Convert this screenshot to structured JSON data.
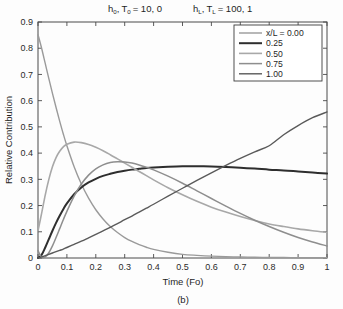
{
  "chart_data": {
    "type": "line",
    "title_parts": {
      "h0_base": "h",
      "h0_sub": "0",
      "t0_base": "T",
      "t0_sub": "0",
      "left_values": "= 10, 0",
      "hL_base": "h",
      "hL_sub": "L",
      "tL_base": "T",
      "tL_sub": "L",
      "right_values": "= 100, 1",
      "comma": ","
    },
    "xlabel": "Time (Fo)",
    "ylabel": "Relative Contribution",
    "caption": "(b)",
    "xlim": [
      0,
      1
    ],
    "ylim": [
      0,
      0.9
    ],
    "grid": false,
    "legend_position": "top-right",
    "legend_title": "x/L = 0.00",
    "xticks": [
      0,
      0.1,
      0.2,
      0.3,
      0.4,
      0.5,
      0.6,
      0.7,
      0.8,
      0.9,
      1
    ],
    "xticklabels": [
      "0",
      "0.1",
      "0.2",
      "0.3",
      "0.4",
      "0.5",
      "0.6",
      "0.7",
      "0.8",
      "0.9",
      "1"
    ],
    "yticks": [
      0,
      0.1,
      0.2,
      0.3,
      0.4,
      0.5,
      0.6,
      0.7,
      0.8,
      0.9
    ],
    "yticklabels": [
      "0",
      "0.1",
      "0.2",
      "0.3",
      "0.4",
      "0.5",
      "0.6",
      "0.7",
      "0.8",
      "0.9"
    ],
    "x": [
      0,
      0.0125,
      0.025,
      0.0375,
      0.05,
      0.0625,
      0.075,
      0.0875,
      0.1,
      0.125,
      0.15,
      0.175,
      0.2,
      0.225,
      0.25,
      0.275,
      0.3,
      0.325,
      0.35,
      0.375,
      0.4,
      0.45,
      0.5,
      0.55,
      0.6,
      0.65,
      0.7,
      0.75,
      0.8,
      0.85,
      0.9,
      0.95,
      1
    ],
    "series": [
      {
        "name": "x/L = 0.00",
        "label": "x/L = 0.00",
        "legend_label": "x/L = 0.00",
        "color": "#9a9a9a",
        "width": 1.4,
        "values": [
          0.852,
          0.8,
          0.742,
          0.684,
          0.628,
          0.574,
          0.522,
          0.473,
          0.428,
          0.348,
          0.282,
          0.228,
          0.184,
          0.149,
          0.12,
          0.097,
          0.078,
          0.063,
          0.051,
          0.041,
          0.033,
          0.022,
          0.014,
          0.01,
          0.007,
          0.005,
          0.004,
          0.003,
          0.002,
          0.002,
          0.001,
          0.001,
          0.001
        ]
      },
      {
        "name": "0.25",
        "label": "0.25",
        "legend_label": "0.25",
        "color": "#2e2e2e",
        "width": 2.0,
        "values": [
          0.0,
          0.012,
          0.04,
          0.072,
          0.104,
          0.134,
          0.161,
          0.186,
          0.208,
          0.243,
          0.269,
          0.288,
          0.302,
          0.313,
          0.321,
          0.328,
          0.333,
          0.337,
          0.34,
          0.343,
          0.345,
          0.348,
          0.35,
          0.35,
          0.349,
          0.347,
          0.344,
          0.341,
          0.337,
          0.334,
          0.33,
          0.326,
          0.322
        ]
      },
      {
        "name": "0.50",
        "label": "0.50",
        "legend_label": "0.50",
        "color": "#a8a8a8",
        "width": 1.6,
        "values": [
          0.104,
          0.17,
          0.24,
          0.3,
          0.348,
          0.383,
          0.407,
          0.424,
          0.434,
          0.442,
          0.44,
          0.433,
          0.422,
          0.409,
          0.394,
          0.378,
          0.362,
          0.346,
          0.33,
          0.314,
          0.298,
          0.268,
          0.241,
          0.216,
          0.194,
          0.175,
          0.158,
          0.143,
          0.13,
          0.12,
          0.111,
          0.104,
          0.098
        ]
      },
      {
        "name": "0.75",
        "label": "0.75",
        "legend_label": "0.75",
        "color": "#8e8e8e",
        "width": 1.5,
        "values": [
          0.028,
          0.003,
          0.004,
          0.02,
          0.046,
          0.078,
          0.112,
          0.146,
          0.178,
          0.236,
          0.282,
          0.316,
          0.34,
          0.355,
          0.364,
          0.367,
          0.366,
          0.362,
          0.355,
          0.346,
          0.336,
          0.312,
          0.285,
          0.256,
          0.227,
          0.198,
          0.17,
          0.144,
          0.12,
          0.098,
          0.078,
          0.061,
          0.046
        ]
      },
      {
        "name": "1.00",
        "label": "1.00",
        "legend_label": "1.00",
        "color": "#5a5a5a",
        "width": 1.4,
        "values": [
          0.0,
          0.004,
          0.009,
          0.014,
          0.019,
          0.024,
          0.029,
          0.034,
          0.04,
          0.052,
          0.064,
          0.077,
          0.09,
          0.103,
          0.117,
          0.131,
          0.146,
          0.16,
          0.175,
          0.19,
          0.205,
          0.236,
          0.266,
          0.296,
          0.325,
          0.353,
          0.38,
          0.405,
          0.428,
          0.47,
          0.505,
          0.535,
          0.557
        ]
      }
    ]
  },
  "figure": {
    "background": "#ffffff",
    "axis_color": "#4a4a4a"
  }
}
